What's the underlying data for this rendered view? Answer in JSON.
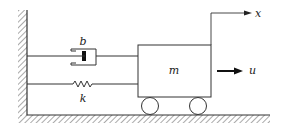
{
  "diagram": {
    "labels": {
      "damper": "b",
      "spring": "k",
      "mass": "m",
      "input": "u",
      "position": "x"
    },
    "colors": {
      "line": "#333333",
      "background": "#ffffff"
    }
  }
}
